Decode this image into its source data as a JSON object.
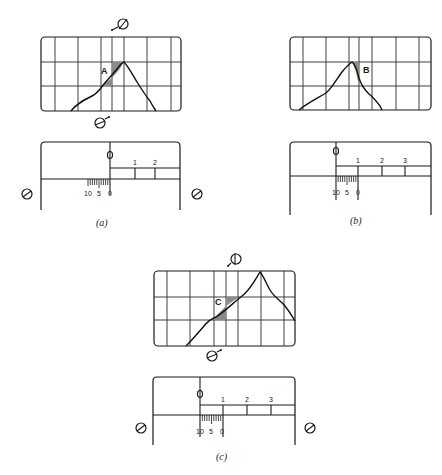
{
  "figure": {
    "panels": [
      {
        "id": "a",
        "caption": "(a)",
        "region_label": "A",
        "scale_labels": [
          "1",
          "2"
        ],
        "vernier_labels": [
          "10",
          "5",
          "0"
        ]
      },
      {
        "id": "b",
        "caption": "(b)",
        "region_label": "B",
        "scale_labels": [
          "1",
          "2",
          "3"
        ],
        "vernier_labels": [
          "10",
          "5",
          "0"
        ]
      },
      {
        "id": "c",
        "caption": "(c)",
        "region_label": "C",
        "scale_labels": [
          "1",
          "2",
          "3"
        ],
        "vernier_labels": [
          "10",
          "5",
          "0"
        ]
      }
    ],
    "knob_icon": "slotted-screw-knob",
    "colors": {
      "ink": "#1a1a1a",
      "shade": "#8a8a8a",
      "background": "#ffffff"
    }
  }
}
